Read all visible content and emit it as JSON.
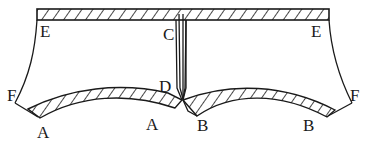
{
  "diagram": {
    "type": "garment-pattern",
    "colors": {
      "stroke": "#1a1a1a",
      "background": "#ffffff"
    },
    "labels": {
      "e_left": "E",
      "e_right": "E",
      "c": "C",
      "d": "D",
      "f_left": "F",
      "f_right": "F",
      "a_left": "A",
      "a_right": "A",
      "b_left": "B",
      "b_right": "B"
    },
    "regions": [
      {
        "name": "waistband",
        "hatched": true
      },
      {
        "name": "left-leg-facing",
        "between": [
          "A",
          "A"
        ],
        "hatched": true
      },
      {
        "name": "right-leg-facing",
        "between": [
          "B",
          "B"
        ],
        "hatched": true
      },
      {
        "name": "center-slit",
        "between": [
          "C",
          "D"
        ]
      }
    ]
  }
}
